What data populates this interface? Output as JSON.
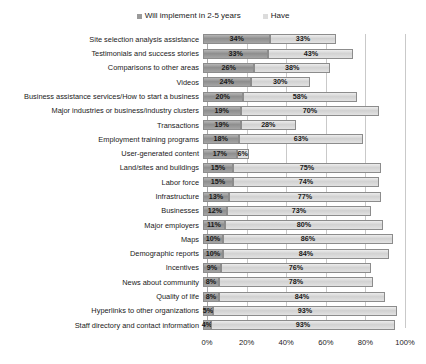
{
  "legend": {
    "position": "top-center",
    "entries": [
      {
        "label": "Will implement in 2-5 years",
        "color": "#9a9a9a",
        "icon": "legend-square-icon"
      },
      {
        "label": "Have",
        "color": "#dcdcdc",
        "icon": "legend-square-icon"
      }
    ]
  },
  "chart_data": {
    "type": "bar",
    "orientation": "horizontal",
    "stacked": true,
    "title": "",
    "subtitle": "",
    "xlabel": "",
    "ylabel": "",
    "xlim": [
      0,
      100
    ],
    "xticks": [
      "0%",
      "20%",
      "40%",
      "60%",
      "80%",
      "100%"
    ],
    "xtick_values": [
      0,
      20,
      40,
      60,
      80,
      100
    ],
    "grid": true,
    "grid_axis": "x",
    "legend_position": "top-center",
    "categories": [
      "Site selection analysis assistance",
      "Testimonials and success stories",
      "Comparisons to other areas",
      "Videos",
      "Business assistance services/How to start a business",
      "Major industries or business/industry clusters",
      "Transactions",
      "Employment training programs",
      "User-generated content",
      "Land/sites and buildings",
      "Labor force",
      "Infrastructure",
      "Businesses",
      "Major employers",
      "Maps",
      "Demographic reports",
      "Incentives",
      "News about community",
      "Quality of life",
      "Hyperlinks to other organizations",
      "Staff directory and contact information"
    ],
    "series": [
      {
        "name": "Will implement in 2-5 years",
        "color": "#9a9a9a",
        "values": [
          34,
          33,
          26,
          24,
          20,
          19,
          19,
          18,
          17,
          15,
          15,
          13,
          12,
          11,
          10,
          10,
          9,
          8,
          8,
          5,
          4
        ],
        "labels": [
          "34%",
          "33%",
          "26%",
          "24%",
          "20%",
          "19%",
          "19%",
          "18%",
          "17%",
          "15%",
          "15%",
          "13%",
          "12%",
          "11%",
          "10%",
          "10%",
          "9%",
          "8%",
          "8%",
          "5%",
          "4%"
        ]
      },
      {
        "name": "Have",
        "color": "#dcdcdc",
        "values": [
          33,
          43,
          38,
          30,
          58,
          70,
          28,
          63,
          6,
          75,
          74,
          77,
          73,
          80,
          86,
          84,
          76,
          78,
          84,
          93,
          93
        ],
        "labels": [
          "33%",
          "43%",
          "38%",
          "30%",
          "58%",
          "70%",
          "28%",
          "63%",
          "6%",
          "75%",
          "74%",
          "77%",
          "73%",
          "80%",
          "86%",
          "84%",
          "76%",
          "78%",
          "84%",
          "93%",
          "93%"
        ]
      }
    ]
  }
}
